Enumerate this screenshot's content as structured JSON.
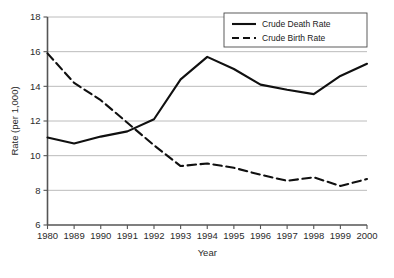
{
  "chart_data": {
    "type": "line",
    "title": "",
    "subtitle": "",
    "xlabel": "Year",
    "ylabel": "Rate (per 1,000)",
    "categories": [
      "1980",
      "1989",
      "1990",
      "1991",
      "1992",
      "1993",
      "1994",
      "1995",
      "1996",
      "1997",
      "1998",
      "1999",
      "2000"
    ],
    "ylim": [
      6,
      18
    ],
    "yticks": [
      "6",
      "8",
      "10",
      "12",
      "14",
      "16",
      "18"
    ],
    "ytick_values": [
      6,
      8,
      10,
      12,
      14,
      16,
      18
    ],
    "grid": "horizontal",
    "legend_position": "top-right",
    "series": [
      {
        "name": "Crude Death Rate",
        "style": "solid",
        "color": "#101010",
        "values": [
          11.05,
          10.7,
          11.1,
          11.4,
          12.1,
          14.4,
          15.7,
          15.0,
          14.1,
          13.8,
          13.55,
          14.6,
          15.3
        ]
      },
      {
        "name": "Crude Birth Rate",
        "style": "dashed",
        "color": "#101010",
        "values": [
          15.9,
          14.2,
          13.2,
          11.9,
          10.6,
          9.4,
          9.55,
          9.3,
          8.9,
          8.55,
          8.75,
          8.25,
          8.65
        ]
      }
    ]
  },
  "legend": {
    "items": [
      {
        "label": "Crude Death Rate",
        "style": "solid"
      },
      {
        "label": "Crude Birth Rate",
        "style": "dashed"
      }
    ]
  },
  "axes": {
    "x_title": "Year",
    "y_title": "Rate (per 1,000)"
  },
  "colors": {
    "line": "#101010",
    "grid": "#b4b4b4",
    "axis": "#555555",
    "background": "#ffffff",
    "text": "#1a1a1a"
  }
}
